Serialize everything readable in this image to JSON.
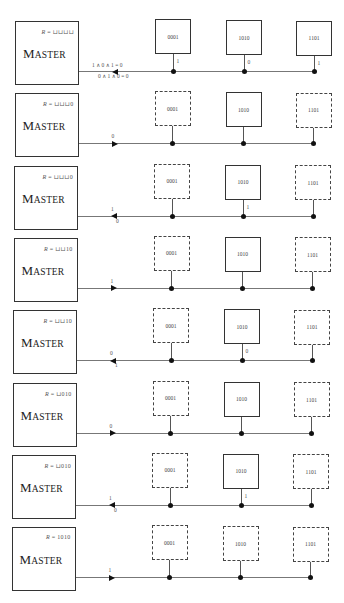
{
  "diagram": {
    "master_label": "MASTER",
    "slave_ids": [
      "0001",
      "1010",
      "1101"
    ],
    "colors": {
      "line": "#333333",
      "bus": "#777777",
      "dot": "#111111"
    },
    "panels": [
      {
        "register": "R = ⊔⊔⊔⊔",
        "bus_direction": "left",
        "bus_label_above": "1 ∧ 0 ∧ 1 = 0",
        "bus_label_below": "0 ∧ 1 ∧ 0 = 0",
        "slaves": [
          {
            "id": "0001",
            "style": "solid",
            "bit": "1"
          },
          {
            "id": "1010",
            "style": "solid",
            "bit": "0"
          },
          {
            "id": "1101",
            "style": "solid",
            "bit": "1"
          }
        ]
      },
      {
        "register": "R = ⊔⊔⊔0",
        "bus_direction": "right",
        "bus_label_above": "0",
        "bus_label_below": "",
        "slaves": [
          {
            "id": "0001",
            "style": "dashed",
            "bit": ""
          },
          {
            "id": "1010",
            "style": "solid",
            "bit": ""
          },
          {
            "id": "1101",
            "style": "dashed",
            "bit": ""
          }
        ]
      },
      {
        "register": "R = ⊔⊔⊔0",
        "bus_direction": "left",
        "bus_label_above": "1",
        "bus_label_below": "0",
        "slaves": [
          {
            "id": "0001",
            "style": "dashed",
            "bit": ""
          },
          {
            "id": "1010",
            "style": "solid",
            "bit": "1"
          },
          {
            "id": "1101",
            "style": "dashed",
            "bit": ""
          }
        ]
      },
      {
        "register": "R = ⊔⊔10",
        "bus_direction": "right",
        "bus_label_above": "1",
        "bus_label_below": "",
        "slaves": [
          {
            "id": "0001",
            "style": "dashed",
            "bit": ""
          },
          {
            "id": "1010",
            "style": "solid",
            "bit": ""
          },
          {
            "id": "1101",
            "style": "dashed",
            "bit": ""
          }
        ]
      },
      {
        "register": "R = ⊔⊔10",
        "bus_direction": "left",
        "bus_label_above": "0",
        "bus_label_below": "1",
        "slaves": [
          {
            "id": "0001",
            "style": "dashed",
            "bit": ""
          },
          {
            "id": "1010",
            "style": "solid",
            "bit": "0"
          },
          {
            "id": "1101",
            "style": "dashed",
            "bit": ""
          }
        ]
      },
      {
        "register": "R = ⊔010",
        "bus_direction": "right",
        "bus_label_above": "0",
        "bus_label_below": "",
        "slaves": [
          {
            "id": "0001",
            "style": "dashed",
            "bit": ""
          },
          {
            "id": "1010",
            "style": "solid",
            "bit": ""
          },
          {
            "id": "1101",
            "style": "dashed",
            "bit": ""
          }
        ]
      },
      {
        "register": "R = ⊔010",
        "bus_direction": "left",
        "bus_label_above": "1",
        "bus_label_below": "0",
        "slaves": [
          {
            "id": "0001",
            "style": "dashed",
            "bit": ""
          },
          {
            "id": "1010",
            "style": "solid",
            "bit": "1"
          },
          {
            "id": "1101",
            "style": "dashed",
            "bit": ""
          }
        ]
      },
      {
        "register": "R = 1010",
        "bus_direction": "right",
        "bus_label_above": "1",
        "bus_label_below": "",
        "slaves": [
          {
            "id": "0001",
            "style": "dashed",
            "bit": ""
          },
          {
            "id": "1010",
            "style": "dashed",
            "bit": ""
          },
          {
            "id": "1101",
            "style": "dashed",
            "bit": ""
          }
        ]
      }
    ]
  }
}
